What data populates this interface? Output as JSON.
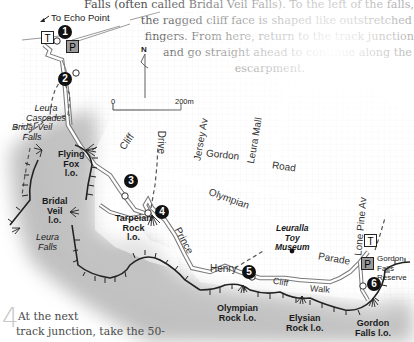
{
  "intro_paragraph": {
    "lines": [
      "Falls (often called Bridal Veil Falls). To the left of the falls,",
      "the ragged cliff face is shaped like outstretched",
      "fingers. From here, return to the track junction",
      "and go straight ahead to continue along the",
      "escarpment."
    ]
  },
  "map": {
    "direction_label": "To Echo Point",
    "north_label": "N",
    "scale": {
      "start": "0",
      "end": "200m"
    },
    "markers": [
      "1",
      "2",
      "3",
      "4",
      "5",
      "6"
    ],
    "symbols": {
      "toilet": "T",
      "parking": "P"
    },
    "streets": {
      "cliff_drive_1": "Cliff",
      "cliff_drive_2": "Drive",
      "jersey_av": "Jersey Av",
      "leura_mall": "Leura Mall",
      "gordon": "Gordon",
      "road": "Road",
      "olympian": "Olympian",
      "parade": "Parade",
      "lone_pine_av": "Lone Pine Av",
      "prince": "Prince",
      "henry": "Henry",
      "cliff2": "Cliff",
      "walk": "Walk"
    },
    "places": {
      "leura_cascades": [
        "Leura",
        "Cascades"
      ],
      "bridal_veil_falls": [
        "Bridal Veil",
        "Falls"
      ],
      "flying_fox": [
        "Flying",
        "Fox",
        "l.o."
      ],
      "bridal_veil_lo": [
        "Bridal",
        "Veil",
        "l.o."
      ],
      "leura_falls": [
        "Leura",
        "Falls"
      ],
      "tarpeian_rock": [
        "Tarpeian",
        "Rock",
        "l.o."
      ],
      "leuralla": [
        "Leuralla",
        "Toy",
        "Museum"
      ],
      "olympian_rock": [
        "Olympian",
        "Rock l.o."
      ],
      "elysian_rock": [
        "Elysian",
        "Rock l.o."
      ],
      "gordon_falls_lo": [
        "Gordon",
        "Falls l.o."
      ],
      "gordon_falls_reserve": [
        "Gordon",
        "Falls",
        "Reserve"
      ]
    }
  },
  "step": {
    "number": "4",
    "lines": [
      "At the next",
      "track junction, take the 50-"
    ]
  }
}
